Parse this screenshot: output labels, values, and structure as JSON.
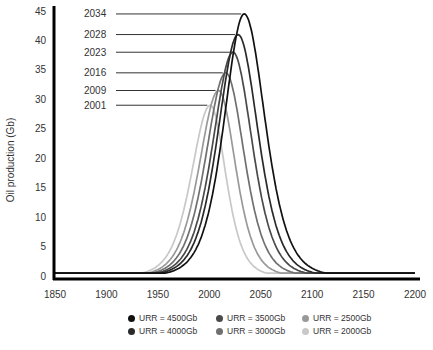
{
  "chart_data": {
    "type": "line",
    "title": "",
    "xlabel": "",
    "ylabel": "Oil production (Gb)",
    "xlim": [
      1850,
      2200
    ],
    "ylim": [
      0,
      45
    ],
    "xticks": [
      1850,
      1900,
      1950,
      2000,
      2050,
      2100,
      2150,
      2200
    ],
    "yticks": [
      0,
      5,
      10,
      15,
      20,
      25,
      30,
      35,
      40,
      45
    ],
    "grid": false,
    "legend_position": "bottom",
    "series": [
      {
        "name": "URR = 4500Gb",
        "color": "#111111",
        "peak_year": 2034,
        "peak_value": 44.5,
        "rise_width": 26,
        "fall_width": 27
      },
      {
        "name": "URR = 4000Gb",
        "color": "#2a2a2a",
        "peak_year": 2028,
        "peak_value": 41,
        "rise_width": 26,
        "fall_width": 26
      },
      {
        "name": "URR = 3500Gb",
        "color": "#4a4a4a",
        "peak_year": 2023,
        "peak_value": 38,
        "rise_width": 26,
        "fall_width": 25
      },
      {
        "name": "URR = 3000Gb",
        "color": "#707070",
        "peak_year": 2016,
        "peak_value": 34.5,
        "rise_width": 25.5,
        "fall_width": 24
      },
      {
        "name": "URR = 2500Gb",
        "color": "#999999",
        "peak_year": 2009,
        "peak_value": 31.5,
        "rise_width": 25,
        "fall_width": 22
      },
      {
        "name": "URR = 2000Gb",
        "color": "#c8c8c8",
        "peak_year": 2001,
        "peak_value": 29,
        "rise_width": 24.5,
        "fall_width": 20
      }
    ],
    "annotations": [
      {
        "label": "2034",
        "peak_year": 2034,
        "peak_value": 44.5
      },
      {
        "label": "2028",
        "peak_year": 2028,
        "peak_value": 41
      },
      {
        "label": "2023",
        "peak_year": 2023,
        "peak_value": 38
      },
      {
        "label": "2016",
        "peak_year": 2016,
        "peak_value": 34.5
      },
      {
        "label": "2009",
        "peak_year": 2009,
        "peak_value": 31.5
      },
      {
        "label": "2001",
        "peak_year": 2001,
        "peak_value": 29
      }
    ]
  },
  "legend": [
    {
      "label": "URR = 4500Gb",
      "color": "#111111"
    },
    {
      "label": "URR = 3500Gb",
      "color": "#4a4a4a"
    },
    {
      "label": "URR = 2500Gb",
      "color": "#999999"
    },
    {
      "label": "URR = 4000Gb",
      "color": "#2a2a2a"
    },
    {
      "label": "URR = 3000Gb",
      "color": "#707070"
    },
    {
      "label": "URR = 2000Gb",
      "color": "#c8c8c8"
    }
  ]
}
